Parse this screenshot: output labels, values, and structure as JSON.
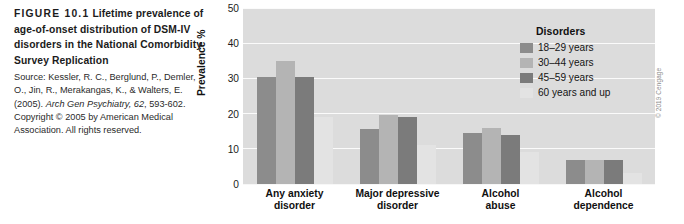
{
  "caption": {
    "figure_label": "FIGURE 10.1",
    "title": "Lifetime prevalence of age-of-onset distribution of DSM-IV disorders in the National Comorbidity Survey Replication",
    "source_prefix": "Source: Kessler, R. C., Berglund, P., Demler, O., Jin, R., Merakangas, K., & Walters, E. (2005). ",
    "source_journal": "Arch Gen Psychiatry, 62",
    "source_suffix": ", 593-602. Copyright © 2005 by American Medical Association. All rights reserved."
  },
  "copyright": "© 2019 Cengage",
  "legend": {
    "title": "Disorders",
    "items": [
      {
        "label": "18–29 years",
        "color": "#8c8c8c"
      },
      {
        "label": "30–44 years",
        "color": "#b4b4b4"
      },
      {
        "label": "45–59 years",
        "color": "#7b7b7b"
      },
      {
        "label": "60 years and up",
        "color": "#e3e3e3"
      }
    ]
  },
  "chart_data": {
    "type": "bar",
    "title": "",
    "xlabel": "",
    "ylabel": "Prevalence %",
    "ylim": [
      0,
      50
    ],
    "yticks": [
      50,
      40,
      30,
      20,
      10,
      0
    ],
    "grid": true,
    "legend_position": "top-right-inside",
    "categories": [
      "Any anxiety disorder",
      "Major depressive disorder",
      "Alcohol abuse",
      "Alcohol dependence"
    ],
    "series": [
      {
        "name": "18–29 years",
        "color": "#8c8c8c",
        "values": [
          30.5,
          15.5,
          14.5,
          6.8
        ]
      },
      {
        "name": "30–44 years",
        "color": "#b4b4b4",
        "values": [
          35.0,
          19.5,
          16.0,
          6.8
        ]
      },
      {
        "name": "45–59 years",
        "color": "#7b7b7b",
        "values": [
          30.5,
          19.0,
          14.0,
          6.8
        ]
      },
      {
        "name": "60 years and up",
        "color": "#e3e3e3",
        "values": [
          19.0,
          11.0,
          9.0,
          3.0
        ]
      }
    ]
  }
}
